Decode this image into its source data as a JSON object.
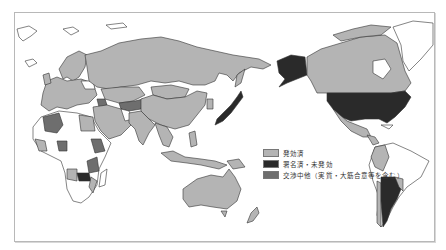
{
  "map": {
    "title": "",
    "colors": {
      "in_force": "#b4b4b4",
      "signed_not_in_force": "#2a2a2a",
      "negotiating": "#6e6e6e",
      "none": "#ffffff",
      "border": "#333333"
    },
    "legend": [
      {
        "key": "in_force",
        "label": "発効済",
        "color": "#b4b4b4"
      },
      {
        "key": "signed_not_in_force",
        "label": "署名済・未発効",
        "color": "#2a2a2a"
      },
      {
        "key": "negotiating",
        "label": "交渉中他（実質・大筋合意等を含む）",
        "color": "#6e6e6e"
      }
    ],
    "regions": [
      {
        "name": "Russia",
        "status": "in_force"
      },
      {
        "name": "China",
        "status": "in_force"
      },
      {
        "name": "Mongolia",
        "status": "in_force"
      },
      {
        "name": "Japan",
        "status": "signed_not_in_force"
      },
      {
        "name": "India",
        "status": "in_force"
      },
      {
        "name": "Southeast Asia",
        "status": "in_force"
      },
      {
        "name": "Australia",
        "status": "in_force"
      },
      {
        "name": "New Zealand",
        "status": "in_force"
      },
      {
        "name": "Europe",
        "status": "in_force"
      },
      {
        "name": "Middle East",
        "status": "in_force"
      },
      {
        "name": "Central Asia",
        "status": "negotiating"
      },
      {
        "name": "Algeria",
        "status": "negotiating"
      },
      {
        "name": "Egypt",
        "status": "in_force"
      },
      {
        "name": "Ethiopia",
        "status": "negotiating"
      },
      {
        "name": "Kenya/Tanzania",
        "status": "negotiating"
      },
      {
        "name": "Zambia",
        "status": "signed_not_in_force"
      },
      {
        "name": "Angola",
        "status": "in_force"
      },
      {
        "name": "Canada",
        "status": "in_force"
      },
      {
        "name": "Alaska",
        "status": "signed_not_in_force"
      },
      {
        "name": "United States",
        "status": "signed_not_in_force"
      },
      {
        "name": "Mexico",
        "status": "in_force"
      },
      {
        "name": "Peru/Colombia",
        "status": "in_force"
      },
      {
        "name": "Argentina",
        "status": "signed_not_in_force"
      },
      {
        "name": "Uruguay",
        "status": "in_force"
      },
      {
        "name": "Chile",
        "status": "in_force"
      },
      {
        "name": "Greenland",
        "status": "none"
      },
      {
        "name": "Brazil",
        "status": "none"
      }
    ]
  }
}
